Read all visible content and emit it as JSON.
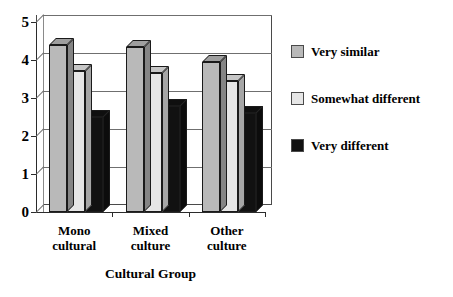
{
  "chart_data": {
    "type": "bar",
    "title": "",
    "xlabel": "Cultural Group",
    "ylabel": "",
    "ylim": [
      0,
      5
    ],
    "yticks": [
      "0",
      "1",
      "2",
      "3",
      "4",
      "5"
    ],
    "grid": true,
    "legend_position": "right",
    "style": "3d-bar",
    "categories": [
      "Mono cultural",
      "Mixed culture",
      "Other culture"
    ],
    "category_lines": [
      [
        "Mono",
        "cultural"
      ],
      [
        "Mixed",
        "culture"
      ],
      [
        "Other",
        "culture"
      ]
    ],
    "series": [
      {
        "name": "Very similar",
        "color": "#b9b9b9",
        "values": [
          4.4,
          4.35,
          3.95
        ]
      },
      {
        "name": "Somewhat different",
        "color": "#e6e6e6",
        "values": [
          3.7,
          3.65,
          3.45
        ]
      },
      {
        "name": "Very different",
        "color": "#111111",
        "values": [
          2.5,
          2.8,
          2.6
        ]
      }
    ]
  },
  "legend": {
    "items": [
      {
        "label": "Very similar"
      },
      {
        "label": "Somewhat different"
      },
      {
        "label": "Very different"
      }
    ]
  },
  "axis": {
    "x_title": "Cultural Group"
  },
  "colors": {
    "series_1": "#b9b9b9",
    "series_2": "#e6e6e6",
    "series_3": "#111111",
    "axis": "#2b2b2b",
    "grid": "#6f6f6f",
    "background": "#ffffff"
  }
}
